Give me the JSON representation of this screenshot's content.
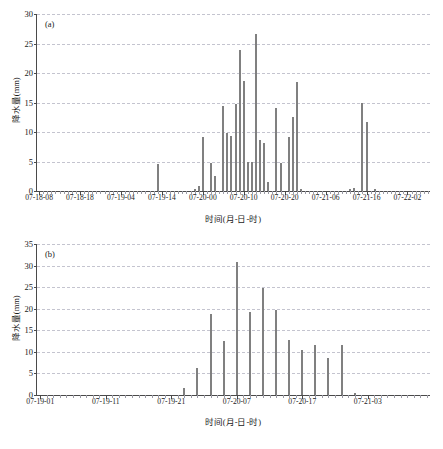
{
  "figure": {
    "background": "#ffffff",
    "bar_color": "#808080",
    "grid_color": "#c4c4cf",
    "axis_color": "#4a4a4a"
  },
  "chart_data": [
    {
      "type": "bar",
      "panel_tag": "(a)",
      "title": "",
      "xlabel": "时间(月-日-时)",
      "ylabel": "降水量(mm)",
      "ylim": [
        0,
        30
      ],
      "yticks": [
        0,
        5,
        10,
        15,
        20,
        25,
        30
      ],
      "ytick_labels": [
        "0",
        "5",
        "10",
        "15",
        "20",
        "25",
        "30"
      ],
      "grid": true,
      "legend": "none",
      "x_start": "07-18-08",
      "x_end": "07-22-07",
      "x_unit": "hour",
      "n_points": 96,
      "xtick_labels": [
        "07-18-08",
        "07-18-18",
        "07-19-04",
        "07-19-14",
        "07-20-00",
        "07-20-10",
        "07-20-20",
        "07-21-06",
        "07-21-16",
        "07-22-02"
      ],
      "xtick_indices": [
        0,
        10,
        20,
        30,
        40,
        50,
        60,
        70,
        80,
        90
      ],
      "values": [
        0,
        0,
        0,
        0,
        0,
        0,
        0,
        0,
        0,
        0,
        0,
        0,
        0,
        0,
        0,
        0,
        0,
        0,
        0,
        0,
        0,
        0,
        0,
        0,
        0,
        0,
        0,
        0,
        0,
        4.6,
        0,
        0,
        0,
        0,
        0,
        0,
        0,
        0,
        0.4,
        0.9,
        9.1,
        0,
        4.8,
        2.6,
        0,
        14.4,
        9.8,
        9.4,
        14.7,
        23.9,
        18.7,
        5.0,
        4.9,
        26.6,
        8.6,
        8.2,
        1.5,
        0,
        14.1,
        4.8,
        0,
        9.1,
        12.6,
        18.4,
        0.4,
        0,
        0,
        0,
        0,
        0,
        0,
        0,
        0,
        0,
        0,
        0,
        0.3,
        0.5,
        0,
        14.9,
        11.7,
        0,
        0.4,
        0,
        0,
        0,
        0,
        0,
        0,
        0,
        0,
        0,
        0,
        0,
        0,
        0
      ]
    },
    {
      "type": "bar",
      "panel_tag": "(b)",
      "title": "",
      "xlabel": "时间(月-日-时)",
      "ylabel": "降水量(mm)",
      "ylim": [
        0,
        35
      ],
      "yticks": [
        0,
        5,
        10,
        15,
        20,
        25,
        30,
        35
      ],
      "ytick_labels": [
        "0",
        "5",
        "10",
        "15",
        "20",
        "25",
        "30",
        "35"
      ],
      "grid": true,
      "legend": "none",
      "x_start": "07-19-01",
      "x_end": "07-21-12",
      "x_unit": "hour",
      "n_points": 60,
      "xtick_labels": [
        "07-19-01",
        "07-19-11",
        "07-19-21",
        "07-20-07",
        "07-20-17",
        "07-21-03"
      ],
      "xtick_indices": [
        0,
        10,
        20,
        30,
        40,
        50
      ],
      "values": [
        0,
        0,
        0,
        0,
        0,
        0,
        0,
        0,
        0,
        0,
        0,
        0,
        0,
        0,
        0,
        0,
        0,
        0,
        0,
        0,
        0,
        0,
        1.6,
        0,
        6.2,
        0,
        18.7,
        0,
        12.5,
        0,
        30.8,
        0,
        19.3,
        0,
        24.7,
        0,
        19.7,
        0,
        12.8,
        0,
        10.4,
        0,
        11.5,
        0,
        8.6,
        0,
        11.7,
        0,
        0.4,
        0,
        0,
        0,
        0,
        0,
        0,
        0,
        0,
        0,
        0,
        0
      ]
    }
  ]
}
